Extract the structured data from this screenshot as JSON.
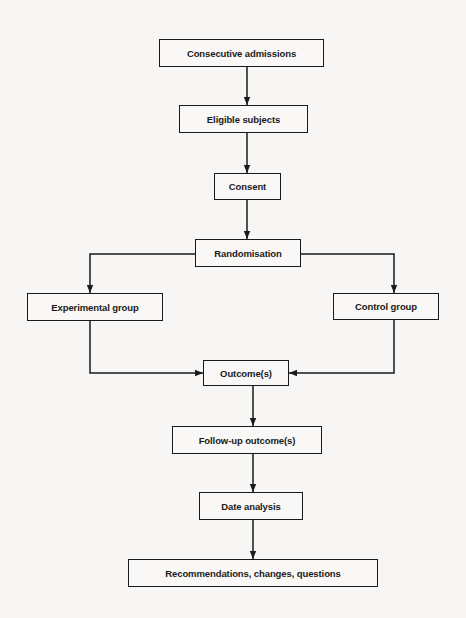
{
  "diagram": {
    "type": "flowchart",
    "title": "",
    "nodes": [
      {
        "id": "admissions",
        "label": "Consecutive admissions"
      },
      {
        "id": "eligible",
        "label": "Eligible subjects"
      },
      {
        "id": "consent",
        "label": "Consent"
      },
      {
        "id": "randomisation",
        "label": "Randomisation"
      },
      {
        "id": "experimental",
        "label": "Experimental group"
      },
      {
        "id": "control",
        "label": "Control group"
      },
      {
        "id": "outcomes",
        "label": "Outcome(s)"
      },
      {
        "id": "followup",
        "label": "Follow-up outcome(s)"
      },
      {
        "id": "analysis",
        "label": "Date analysis"
      },
      {
        "id": "recommendations",
        "label": "Recommendations, changes, questions"
      }
    ],
    "edges": [
      {
        "from": "admissions",
        "to": "eligible"
      },
      {
        "from": "eligible",
        "to": "consent"
      },
      {
        "from": "consent",
        "to": "randomisation"
      },
      {
        "from": "randomisation",
        "to": "experimental"
      },
      {
        "from": "randomisation",
        "to": "control"
      },
      {
        "from": "experimental",
        "to": "outcomes"
      },
      {
        "from": "control",
        "to": "outcomes"
      },
      {
        "from": "outcomes",
        "to": "followup"
      },
      {
        "from": "followup",
        "to": "analysis"
      },
      {
        "from": "analysis",
        "to": "recommendations"
      }
    ]
  }
}
